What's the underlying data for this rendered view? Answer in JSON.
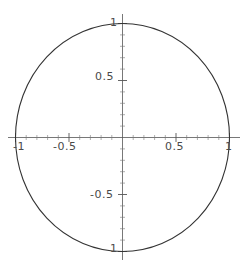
{
  "chart_data": {
    "type": "line",
    "title": "",
    "subtitle": "",
    "xlabel": "",
    "ylabel": "",
    "grid": false,
    "legend": null,
    "xlim": [
      -1.05,
      1.05
    ],
    "ylim": [
      -1.05,
      1.05
    ],
    "axis_style": "crossed-at-origin",
    "xticks": [
      -1,
      -0.5,
      0.5,
      1
    ],
    "yticks": [
      -1,
      -0.5,
      0.5,
      1
    ],
    "xtick_labels": [
      "-1",
      "-0.5",
      "0.5",
      "1"
    ],
    "ytick_labels": [
      "1",
      "0.5",
      "-0.5",
      "1"
    ],
    "series": [
      {
        "name": "unit circle",
        "kind": "parametric",
        "equation": "(cos t, sin t), 0 <= t <= 2*pi",
        "color": "#333333",
        "radius": 1,
        "center": [
          0,
          0
        ],
        "x": [
          1,
          0.9659,
          0.866,
          0.7071,
          0.5,
          0.2588,
          0,
          -0.2588,
          -0.5,
          -0.7071,
          -0.866,
          -0.9659,
          -1,
          -0.9659,
          -0.866,
          -0.7071,
          -0.5,
          -0.2588,
          0,
          0.2588,
          0.5,
          0.7071,
          0.866,
          0.9659,
          1
        ],
        "y": [
          0,
          0.2588,
          0.5,
          0.7071,
          0.866,
          0.9659,
          1,
          0.9659,
          0.866,
          0.7071,
          0.5,
          0.2588,
          0,
          -0.2588,
          -0.5,
          -0.7071,
          -0.866,
          -0.9659,
          -1,
          -0.9659,
          -0.866,
          -0.7071,
          -0.5,
          -0.2588,
          0
        ]
      }
    ]
  },
  "labels": {
    "x_neg_one": "-1",
    "x_neg_half": "-0.5",
    "x_pos_half": "0.5",
    "x_pos_one": "1",
    "y_pos_one": "1",
    "y_pos_half": "0.5",
    "y_neg_half": "-0.5",
    "y_neg_one": "1"
  },
  "colors": {
    "curve": "#333333",
    "axis": "#555555",
    "tick": "#555555",
    "label_text": "#4a4a4a",
    "background": "#ffffff"
  }
}
